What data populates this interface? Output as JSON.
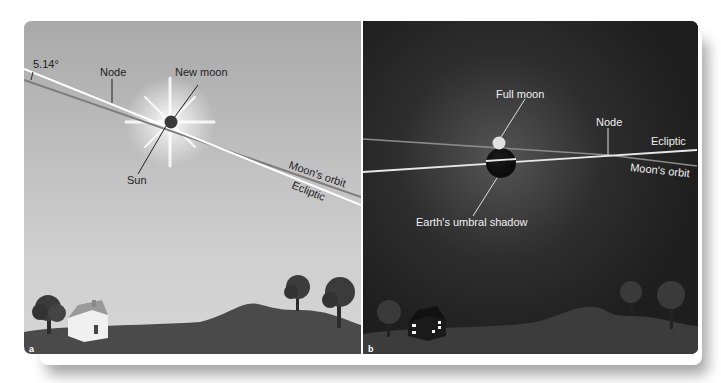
{
  "panel_a": {
    "letter": "a",
    "angle_label": "5.14°",
    "node_label": "Node",
    "new_moon_label": "New moon",
    "sun_label": "Sun",
    "moon_orbit_label": "Moon's orbit",
    "ecliptic_label": "Ecliptic",
    "sky_color_top": "#a7a7a7",
    "sky_color_bottom": "#d2d2d2",
    "ground_color": "#4a4a4a"
  },
  "panel_b": {
    "letter": "b",
    "full_moon_label": "Full moon",
    "node_label": "Node",
    "ecliptic_label": "Ecliptic",
    "moon_orbit_label": "Moon's orbit",
    "umbra_label": "Earth's umbral shadow",
    "sky_color": "#232323",
    "ground_color": "#3c3c3c"
  }
}
